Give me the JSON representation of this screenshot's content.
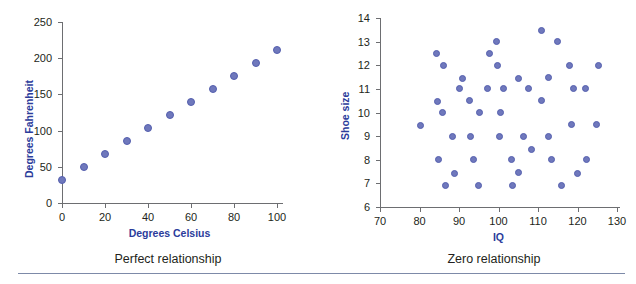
{
  "figure": {
    "background": "#ffffff",
    "dot_color": "#6f78bc",
    "dot_stroke": "#545fae",
    "axis_color": "#6d6e71",
    "axis_title_color": "#2b3c9b",
    "caption_color": "#231f20",
    "rule_color": "#7d8aa8"
  },
  "captions": {
    "left": "Perfect relationship",
    "right": "Zero relationship"
  },
  "chart_data": [
    {
      "type": "scatter",
      "title": "Perfect relationship",
      "xlabel": "Degrees Celsius",
      "ylabel": "Degrees Fahrenheit",
      "xlim": [
        0,
        100
      ],
      "ylim": [
        0,
        250
      ],
      "xticks": [
        0,
        20,
        40,
        60,
        80,
        100
      ],
      "yticks": [
        0,
        50,
        100,
        150,
        200,
        250
      ],
      "xtick_labels": [
        "0",
        "20",
        "40",
        "60",
        "80",
        "100"
      ],
      "ytick_labels": [
        "0",
        "50",
        "100",
        "150",
        "200",
        "250"
      ],
      "grid": false,
      "legend": "none",
      "relationship": "F = 1.8 x C + 32",
      "points": [
        {
          "x": 0,
          "y": 32
        },
        {
          "x": 10,
          "y": 50
        },
        {
          "x": 20,
          "y": 68
        },
        {
          "x": 30,
          "y": 86
        },
        {
          "x": 40,
          "y": 104
        },
        {
          "x": 50,
          "y": 122
        },
        {
          "x": 60,
          "y": 140
        },
        {
          "x": 70,
          "y": 158
        },
        {
          "x": 80,
          "y": 176
        },
        {
          "x": 90,
          "y": 194
        },
        {
          "x": 100,
          "y": 212
        }
      ]
    },
    {
      "type": "scatter",
      "title": "Zero relationship",
      "xlabel": "IQ",
      "ylabel": "Shoe size",
      "xlim": [
        70,
        130
      ],
      "ylim": [
        6,
        14
      ],
      "xticks": [
        70,
        80,
        90,
        100,
        110,
        120,
        130
      ],
      "yticks": [
        6,
        7,
        8,
        9,
        10,
        11,
        12,
        13,
        14
      ],
      "xtick_labels": [
        "70",
        "80",
        "90",
        "100",
        "110",
        "120",
        "130"
      ],
      "ytick_labels": [
        "6",
        "7",
        "8",
        "9",
        "10",
        "11",
        "12",
        "13",
        "14"
      ],
      "grid": false,
      "legend": "none",
      "relationship": "no correlation",
      "points": [
        {
          "x": 80.3,
          "y": 9.45
        },
        {
          "x": 84.3,
          "y": 12.5
        },
        {
          "x": 84.6,
          "y": 10.45
        },
        {
          "x": 84.8,
          "y": 8.0
        },
        {
          "x": 85.7,
          "y": 10.0
        },
        {
          "x": 86.1,
          "y": 12.0
        },
        {
          "x": 86.6,
          "y": 6.9
        },
        {
          "x": 88.3,
          "y": 9.0
        },
        {
          "x": 88.9,
          "y": 7.4
        },
        {
          "x": 90.2,
          "y": 11.0
        },
        {
          "x": 90.9,
          "y": 11.45
        },
        {
          "x": 92.6,
          "y": 10.5
        },
        {
          "x": 93.0,
          "y": 9.0
        },
        {
          "x": 93.7,
          "y": 8.0
        },
        {
          "x": 95.0,
          "y": 6.9
        },
        {
          "x": 95.3,
          "y": 10.0
        },
        {
          "x": 97.3,
          "y": 11.0
        },
        {
          "x": 97.7,
          "y": 12.5
        },
        {
          "x": 99.4,
          "y": 13.0
        },
        {
          "x": 99.8,
          "y": 12.0
        },
        {
          "x": 100.3,
          "y": 9.0
        },
        {
          "x": 100.6,
          "y": 10.0
        },
        {
          "x": 101.2,
          "y": 11.0
        },
        {
          "x": 103.3,
          "y": 8.0
        },
        {
          "x": 103.6,
          "y": 6.9
        },
        {
          "x": 105.0,
          "y": 11.45
        },
        {
          "x": 105.1,
          "y": 7.45
        },
        {
          "x": 106.4,
          "y": 9.0
        },
        {
          "x": 107.7,
          "y": 11.0
        },
        {
          "x": 108.3,
          "y": 8.45
        },
        {
          "x": 110.8,
          "y": 13.45
        },
        {
          "x": 110.9,
          "y": 10.5
        },
        {
          "x": 112.6,
          "y": 11.5
        },
        {
          "x": 112.7,
          "y": 9.0
        },
        {
          "x": 113.4,
          "y": 8.0
        },
        {
          "x": 114.9,
          "y": 13.0
        },
        {
          "x": 116.0,
          "y": 6.9
        },
        {
          "x": 117.9,
          "y": 12.0
        },
        {
          "x": 118.5,
          "y": 9.5
        },
        {
          "x": 118.9,
          "y": 11.0
        },
        {
          "x": 120.0,
          "y": 7.4
        },
        {
          "x": 121.9,
          "y": 11.0
        },
        {
          "x": 122.3,
          "y": 8.0
        },
        {
          "x": 124.8,
          "y": 9.5
        },
        {
          "x": 125.3,
          "y": 12.0
        }
      ]
    }
  ]
}
